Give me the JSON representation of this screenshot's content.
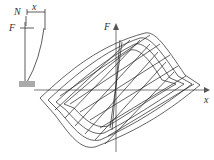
{
  "inset": {
    "labels": {
      "N": "N",
      "x": "x",
      "F": "F"
    }
  },
  "plot": {
    "axes": {
      "y_label": "F",
      "x_label": "x"
    },
    "curve_description": "hysteresis loops (force-displacement)",
    "colors": {
      "line": "#222222",
      "axis": "#555555",
      "base": "#999999"
    }
  }
}
